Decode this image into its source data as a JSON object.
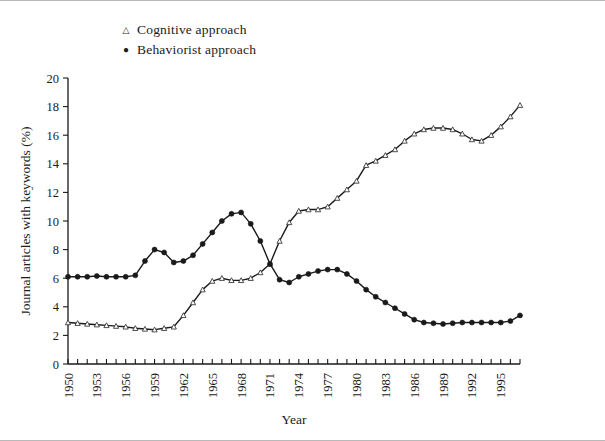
{
  "legend": {
    "position": "top-left-inside",
    "items": [
      {
        "label": "Cognitive approach",
        "marker": "open-triangle-icon",
        "glyph": "△"
      },
      {
        "label": "Behaviorist approach",
        "marker": "filled-circle-icon",
        "glyph": "●"
      }
    ]
  },
  "chart_data": {
    "type": "line",
    "title": "",
    "xlabel": "Year",
    "ylabel": "Journal articles with keywords (%)",
    "xlim": [
      1950,
      1997
    ],
    "ylim": [
      0,
      20
    ],
    "ytick_step": 2,
    "yticks": [
      0,
      2,
      4,
      6,
      8,
      10,
      12,
      14,
      16,
      18,
      20
    ],
    "xtick_step": 1,
    "xtick_label_step": 3,
    "xticklabels": [
      "1950",
      "1953",
      "1956",
      "1959",
      "1962",
      "1965",
      "1968",
      "1971",
      "1974",
      "1977",
      "1980",
      "1983",
      "1986",
      "1989",
      "1992",
      "1995"
    ],
    "grid": false,
    "legend_position": "upper left",
    "x": [
      1950,
      1951,
      1952,
      1953,
      1954,
      1955,
      1956,
      1957,
      1958,
      1959,
      1960,
      1961,
      1962,
      1963,
      1964,
      1965,
      1966,
      1967,
      1968,
      1969,
      1970,
      1971,
      1972,
      1973,
      1974,
      1975,
      1976,
      1977,
      1978,
      1979,
      1980,
      1981,
      1982,
      1983,
      1984,
      1985,
      1986,
      1987,
      1988,
      1989,
      1990,
      1991,
      1992,
      1993,
      1994,
      1995,
      1996,
      1997
    ],
    "series": [
      {
        "name": "Cognitive approach",
        "marker": "open-triangle",
        "values": [
          2.9,
          2.85,
          2.8,
          2.75,
          2.7,
          2.65,
          2.6,
          2.5,
          2.45,
          2.4,
          2.5,
          2.6,
          3.4,
          4.3,
          5.2,
          5.8,
          6.0,
          5.85,
          5.85,
          6.0,
          6.4,
          7.0,
          8.6,
          9.9,
          10.7,
          10.8,
          10.8,
          11.0,
          11.6,
          12.2,
          12.8,
          13.9,
          14.2,
          14.6,
          15.0,
          15.6,
          16.1,
          16.4,
          16.5,
          16.5,
          16.4,
          16.1,
          15.7,
          15.6,
          16.0,
          16.6,
          17.3,
          18.1
        ]
      },
      {
        "name": "Behaviorist approach",
        "marker": "filled-circle",
        "values": [
          6.1,
          6.1,
          6.1,
          6.15,
          6.1,
          6.1,
          6.1,
          6.2,
          7.2,
          8.0,
          7.8,
          7.1,
          7.2,
          7.6,
          8.4,
          9.2,
          10.0,
          10.5,
          10.6,
          9.8,
          8.6,
          7.0,
          5.9,
          5.7,
          6.1,
          6.3,
          6.5,
          6.6,
          6.6,
          6.3,
          5.8,
          5.2,
          4.7,
          4.3,
          3.9,
          3.5,
          3.1,
          2.9,
          2.85,
          2.8,
          2.85,
          2.9,
          2.9,
          2.9,
          2.9,
          2.9,
          3.0,
          3.4
        ]
      }
    ]
  }
}
